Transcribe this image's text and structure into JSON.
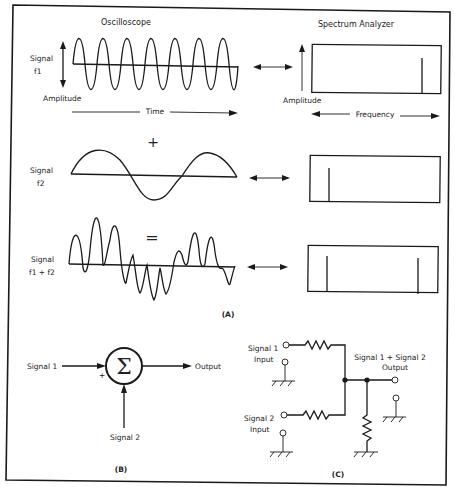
{
  "figure": {
    "panel_a": {
      "label": "(A)",
      "oscilloscope_title": "Oscilloscope",
      "spectrum_title": "Spectrum Analyzer",
      "rows": [
        {
          "signal_label_line1": "Signal",
          "signal_label_line2": "f1",
          "operator": ""
        },
        {
          "signal_label_line1": "Signal",
          "signal_label_line2": "f2",
          "operator": "+"
        },
        {
          "signal_label_line1": "Signal",
          "signal_label_line2": "f1 + f2",
          "operator": "="
        }
      ],
      "amplitude_label_scope": "Amplitude",
      "time_label": "Time",
      "amplitude_label_spectrum": "Amplitude",
      "frequency_label": "Frequency"
    },
    "panel_b": {
      "label": "(B)",
      "input1": "Signal 1",
      "input2": "Signal 2",
      "output": "Output",
      "plus_sign": "+",
      "summer_symbol": "Σ"
    },
    "panel_c": {
      "label": "(C)",
      "input1_line1": "Signal 1",
      "input1_line2": "Input",
      "input2_line1": "Signal 2",
      "input2_line2": "Input",
      "output_line1": "Signal 1 + Signal 2",
      "output_line2": "Output"
    },
    "colors": {
      "ink": "#1a1a1a",
      "background": "#ffffff"
    }
  }
}
